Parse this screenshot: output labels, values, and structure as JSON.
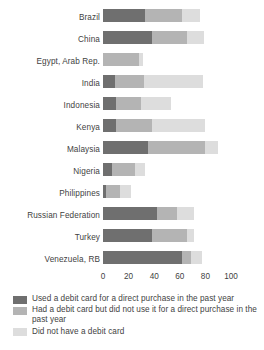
{
  "chart_data": {
    "type": "bar",
    "orientation": "horizontal",
    "stacked": true,
    "title": "",
    "subtitle": "",
    "xlabel": "",
    "ylabel": "",
    "xlim": [
      0,
      100
    ],
    "ylim": null,
    "grid": false,
    "legend_position": "bottom-left",
    "xticks": [
      0,
      20,
      40,
      60,
      80,
      100
    ],
    "xtick_labels": [
      "0",
      "20",
      "40",
      "60",
      "80",
      "100"
    ],
    "categories": [
      "Brazil",
      "China",
      "Egypt, Arab Rep.",
      "India",
      "Indonesia",
      "Kenya",
      "Malaysia",
      "Nigeria",
      "Philippines",
      "Russian Federation",
      "Turkey",
      "Venezuela, RB"
    ],
    "series": [
      {
        "name": "Used a debit card for a direct purchase in the past year",
        "color": "#6f6f6f",
        "values": [
          33,
          38,
          0,
          9,
          10,
          10,
          35,
          7,
          2,
          42,
          38,
          62
        ]
      },
      {
        "name": "Had a debit card but did not use it for a direct purchase in the past year",
        "color": "#b4b4b4",
        "values": [
          29,
          28,
          28,
          23,
          20,
          28,
          45,
          18,
          11,
          16,
          28,
          7
        ]
      },
      {
        "name": "Did not have a debit card",
        "color": "#dddddd",
        "values": [
          14,
          13,
          3,
          46,
          23,
          42,
          10,
          8,
          9,
          13,
          5,
          8
        ]
      }
    ],
    "totals": [
      76,
      79,
      31,
      78,
      53,
      80,
      90,
      33,
      22,
      71,
      71,
      77
    ]
  },
  "legend": {
    "items": [
      {
        "label": "Used a debit card for a direct purchase in the past year",
        "color": "#6f6f6f",
        "swatch_name": "legend-swatch-used"
      },
      {
        "label": "Had a debit card but did not use it for a direct purchase in the past year",
        "color": "#b4b4b4",
        "swatch_name": "legend-swatch-had"
      },
      {
        "label": "Did not have a debit card",
        "color": "#dddddd",
        "swatch_name": "legend-swatch-none"
      }
    ]
  }
}
